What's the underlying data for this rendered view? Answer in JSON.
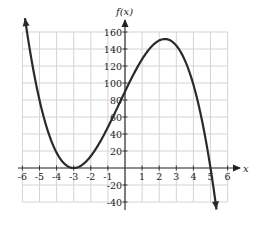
{
  "chart_data": {
    "type": "line",
    "title": "",
    "xlabel": "x",
    "ylabel": "f(x)",
    "xlim": [
      -6,
      6
    ],
    "ylim": [
      -40,
      160
    ],
    "grid": true,
    "x_ticks": [
      -6,
      -5,
      -4,
      -3,
      -2,
      -1,
      1,
      2,
      3,
      4,
      5,
      6
    ],
    "y_ticks": [
      160,
      140,
      120,
      100,
      80,
      60,
      40,
      20,
      -20,
      -40
    ],
    "series": [
      {
        "name": "f(x)",
        "function": "-2(x+3)^2(x-5)",
        "x": [
          -5.85,
          -5,
          -4,
          -3,
          -2,
          -1,
          0,
          1,
          2,
          2.33,
          3,
          4,
          5,
          5.35
        ],
        "y": [
          176,
          80,
          18,
          0,
          14,
          48,
          90,
          128,
          150,
          151.7,
          144,
          98,
          0,
          -68
        ],
        "color": "#2a2a2a",
        "arrows": "both"
      }
    ],
    "key_points": [
      {
        "label": "local minimum",
        "x": -3,
        "y": 0
      },
      {
        "label": "local maximum",
        "x": 2.33,
        "y": 151.7
      },
      {
        "label": "y-intercept",
        "x": 0,
        "y": 90
      },
      {
        "label": "x-intercept",
        "x": 5,
        "y": 0
      }
    ]
  },
  "labels": {
    "x_axis": "x",
    "y_axis": "f(x)"
  }
}
